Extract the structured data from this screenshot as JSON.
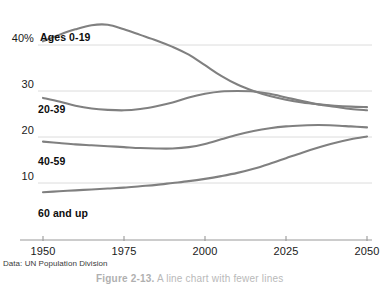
{
  "chart_data": {
    "type": "line",
    "title": "",
    "subtitle": "",
    "xlabel": "",
    "ylabel": "",
    "xlim": [
      1950,
      2050
    ],
    "ylim": [
      0,
      45
    ],
    "grid": true,
    "grid_axis": "y",
    "legend": "inline-labels",
    "x_ticks": [
      "1950",
      "1975",
      "2000",
      "2025",
      "2050"
    ],
    "x_tick_values": [
      1950,
      1975,
      2000,
      2025,
      2050
    ],
    "y_ticks": [
      "40%",
      "30",
      "20",
      "10"
    ],
    "y_tick_values": [
      40,
      30,
      20,
      10
    ],
    "source_note": "Data: UN Population Division",
    "x": [
      1950,
      1955,
      1960,
      1965,
      1970,
      1975,
      1980,
      1985,
      1990,
      1995,
      2000,
      2005,
      2010,
      2015,
      2020,
      2025,
      2030,
      2035,
      2040,
      2045,
      2050
    ],
    "series": [
      {
        "name": "Ages 0-19",
        "label": "Ages 0-19",
        "color": "#808080",
        "values": [
          40.8,
          42.2,
          43.4,
          44.3,
          44.4,
          43.4,
          42.2,
          41.0,
          39.6,
          37.9,
          35.6,
          33.3,
          31.4,
          30.0,
          28.9,
          28.1,
          27.5,
          27.1,
          26.8,
          26.6,
          26.5
        ]
      },
      {
        "name": "20-39",
        "label": "20-39",
        "color": "#808080",
        "values": [
          28.5,
          27.7,
          26.8,
          26.2,
          25.9,
          25.8,
          26.1,
          26.7,
          27.5,
          28.6,
          29.4,
          29.9,
          30.0,
          29.9,
          29.4,
          28.6,
          27.8,
          27.1,
          26.6,
          26.1,
          25.8
        ]
      },
      {
        "name": "40-59",
        "label": "40-59",
        "color": "#808080",
        "values": [
          19.0,
          18.7,
          18.4,
          18.2,
          18.0,
          17.8,
          17.6,
          17.5,
          17.5,
          17.8,
          18.5,
          19.5,
          20.5,
          21.3,
          21.9,
          22.3,
          22.5,
          22.6,
          22.5,
          22.3,
          22.1
        ]
      },
      {
        "name": "60 and up",
        "label": "60 and up",
        "color": "#808080",
        "values": [
          8.0,
          8.2,
          8.4,
          8.6,
          8.8,
          9.0,
          9.3,
          9.6,
          10.0,
          10.4,
          10.9,
          11.5,
          12.2,
          13.1,
          14.2,
          15.4,
          16.6,
          17.7,
          18.7,
          19.5,
          20.1
        ]
      }
    ]
  },
  "footer": {
    "source": "Data: UN Population Division",
    "caption_number": "Figure 2-13.",
    "caption_text": "A line chart with fewer lines"
  },
  "colors": {
    "line": "#808080",
    "grid": "#d8d8d8",
    "axis": "#999999",
    "text": "#1a1a1a"
  }
}
